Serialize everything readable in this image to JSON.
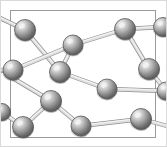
{
  "figure": {
    "width": 167,
    "height": 147,
    "background_color": "#ffffff",
    "atom_fill_color": "#8e8e8e",
    "atom_highlight_color": "#f2f2f2",
    "atom_shadow_color": "#4a4a4a",
    "atom_outline_color": "#555555",
    "bond_color": "#b6b6b6",
    "bond_outline_color": "#7d7d7d",
    "frame_color": "#9a9a9a",
    "frame_line_width": 1
  },
  "frame": {
    "label": "unit-cell-box",
    "x": 10.5,
    "y": 10.5,
    "width": 145,
    "height": 127
  },
  "edge_ticks": [
    {
      "name": "left-tick-upper",
      "x1": 0,
      "y1": 20,
      "x2": 10,
      "y2": 24
    },
    {
      "name": "left-tick-lower",
      "x1": 0,
      "y1": 73,
      "x2": 11,
      "y2": 71
    }
  ],
  "atoms": [
    {
      "id": "a1",
      "label": "atom-1",
      "cx": 25,
      "cy": 30,
      "r": 10.5
    },
    {
      "id": "a2",
      "label": "atom-2",
      "cx": 73,
      "cy": 45,
      "r": 10.0
    },
    {
      "id": "a3",
      "label": "atom-3",
      "cx": 125,
      "cy": 29,
      "r": 10.5
    },
    {
      "id": "a4",
      "label": "atom-4",
      "cx": 163,
      "cy": 27,
      "r": 9.5
    },
    {
      "id": "a5",
      "label": "atom-5",
      "cx": 13,
      "cy": 70,
      "r": 10.0
    },
    {
      "id": "a6",
      "label": "atom-6",
      "cx": 60,
      "cy": 72,
      "r": 10.5
    },
    {
      "id": "a7",
      "label": "atom-7",
      "cx": 149,
      "cy": 69,
      "r": 10.5
    },
    {
      "id": "a8",
      "label": "atom-8",
      "cx": 107,
      "cy": 89,
      "r": 10.0
    },
    {
      "id": "a9",
      "label": "atom-9",
      "cx": 166,
      "cy": 91,
      "r": 9.0
    },
    {
      "id": "a10",
      "label": "atom-10",
      "cx": 51,
      "cy": 101,
      "r": 10.5
    },
    {
      "id": "a11",
      "label": "atom-11",
      "cx": 23,
      "cy": 127,
      "r": 10.5
    },
    {
      "id": "a12",
      "label": "atom-12",
      "cx": 81,
      "cy": 126,
      "r": 10.0
    },
    {
      "id": "a13",
      "label": "atom-13",
      "cx": 141,
      "cy": 119,
      "r": 10.5
    },
    {
      "id": "a14",
      "label": "atom-14",
      "cx": 2,
      "cy": 112,
      "r": 8.5
    }
  ],
  "bonds": [
    {
      "name": "bond-a1-left-edge",
      "from": "a1",
      "to_x": 0,
      "to_y": 18,
      "width": 3.0
    },
    {
      "name": "bond-a1-a6",
      "from": "a1",
      "to": "a6",
      "width": 3.2
    },
    {
      "name": "bond-a2-a6",
      "from": "a2",
      "to": "a6",
      "width": 3.0
    },
    {
      "name": "bond-a2-a3",
      "from": "a2",
      "to": "a3",
      "width": 3.0
    },
    {
      "name": "bond-a2-a5",
      "from": "a2",
      "to": "a5",
      "width": 3.0
    },
    {
      "name": "bond-a3-a4",
      "from": "a3",
      "to": "a4",
      "width": 3.0
    },
    {
      "name": "bond-a3-a7",
      "from": "a3",
      "to": "a7",
      "width": 3.0
    },
    {
      "name": "bond-a5-left-edge",
      "from": "a5",
      "to_x": 0,
      "to_y": 70,
      "width": 3.0
    },
    {
      "name": "bond-a6-a8",
      "from": "a6",
      "to": "a8",
      "width": 3.0
    },
    {
      "name": "bond-a7-a9",
      "from": "a7",
      "to": "a9",
      "width": 3.0
    },
    {
      "name": "bond-a8-a9",
      "from": "a8",
      "to": "a9",
      "width": 3.0
    },
    {
      "name": "bond-a10-a11",
      "from": "a10",
      "to": "a11",
      "width": 3.0
    },
    {
      "name": "bond-a10-a12",
      "from": "a10",
      "to": "a12",
      "width": 3.0
    },
    {
      "name": "bond-a10-upleft",
      "from": "a10",
      "to_x": 6,
      "to_y": 74,
      "width": 3.0
    },
    {
      "name": "bond-a11-a14",
      "from": "a11",
      "to": "a14",
      "width": 3.0
    },
    {
      "name": "bond-a12-a13",
      "from": "a12",
      "to": "a13",
      "width": 3.0
    },
    {
      "name": "bond-a13-right",
      "from": "a13",
      "to_x": 167,
      "to_y": 126,
      "width": 3.0
    }
  ]
}
